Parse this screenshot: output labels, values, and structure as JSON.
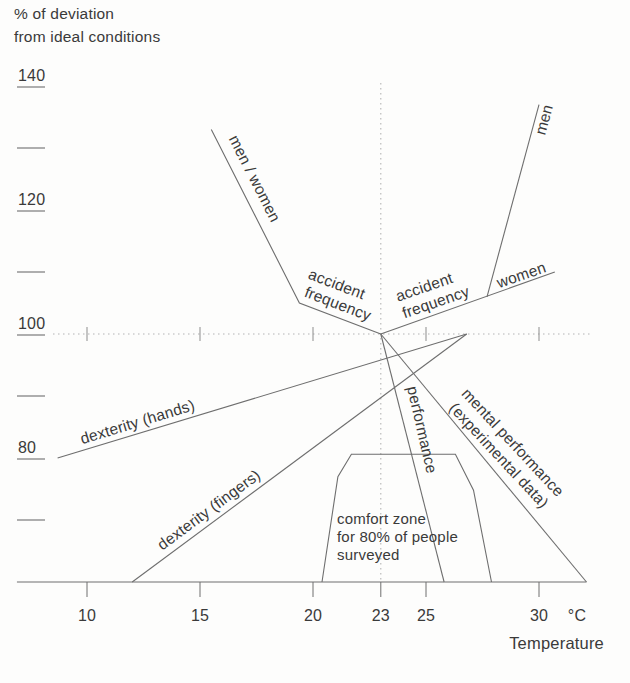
{
  "colors": {
    "ink": "#3a3a3a",
    "line": "#6e6e6e",
    "dotted": "#b4b4b4",
    "background": "#fdfdfc"
  },
  "chart_data": {
    "type": "line",
    "title": "% of deviation from ideal conditions",
    "ylabel_lines": [
      "% of deviation",
      "from ideal conditions"
    ],
    "x_axis": {
      "label": "Temperature",
      "unit": "°C",
      "ticks": [
        10,
        15,
        20,
        23,
        25,
        30
      ],
      "axis_range": [
        6.9,
        32.1
      ]
    },
    "y_axis": {
      "labeled_ticks": [
        140,
        120,
        100,
        80
      ],
      "unlabeled_ticks": [
        130,
        110,
        90,
        70
      ],
      "baseline_value": 60
    },
    "reference": {
      "deviation": 100,
      "temperature": 23,
      "crosshair_ticks": [
        10,
        15,
        20,
        25,
        30
      ],
      "vertical_line_top_value": 140.5
    },
    "series": [
      {
        "name": "accident-frequency-cold",
        "label_key": "men_women_accident",
        "points": [
          [
            15.5,
            133
          ],
          [
            19.4,
            105
          ],
          [
            23,
            100
          ]
        ]
      },
      {
        "name": "accident-frequency-women",
        "label_key": "women_accident",
        "points": [
          [
            23,
            100
          ],
          [
            30.7,
            110
          ]
        ]
      },
      {
        "name": "accident-frequency-men",
        "label_key": "men",
        "points": [
          [
            27.7,
            106
          ],
          [
            30,
            137
          ]
        ]
      },
      {
        "name": "performance",
        "label_key": "performance",
        "points": [
          [
            23,
            100
          ],
          [
            25.8,
            60
          ]
        ]
      },
      {
        "name": "mental-performance",
        "label_key": "mental",
        "points": [
          [
            23,
            100
          ],
          [
            32.1,
            60
          ]
        ]
      },
      {
        "name": "dexterity-hands",
        "label_key": "dexterity_hands",
        "points": [
          [
            8.7,
            80
          ],
          [
            26.8,
            100
          ]
        ]
      },
      {
        "name": "dexterity-fingers",
        "label_key": "dexterity_fingers",
        "points": [
          [
            12,
            60
          ],
          [
            26.8,
            100
          ]
        ]
      },
      {
        "name": "comfort-zone",
        "label_key": "comfort",
        "points": [
          [
            20.4,
            60
          ],
          [
            21.1,
            77
          ],
          [
            21.7,
            80.6
          ],
          [
            26.3,
            80.6
          ],
          [
            27.1,
            74.8
          ],
          [
            27.9,
            60
          ]
        ]
      }
    ],
    "curve_labels": {
      "men_women": "men / women",
      "accident_left": [
        "accident",
        "frequency"
      ],
      "accident_right": [
        "accident",
        "frequency"
      ],
      "women": "women",
      "men": "men",
      "dexterity_hands": "dexterity (hands)",
      "dexterity_fingers": "dexterity (fingers)",
      "performance": "performance",
      "mental": [
        "mental performance",
        "(experimental data)"
      ],
      "comfort": [
        "comfort zone",
        "for 80% of people",
        "surveyed"
      ]
    }
  }
}
